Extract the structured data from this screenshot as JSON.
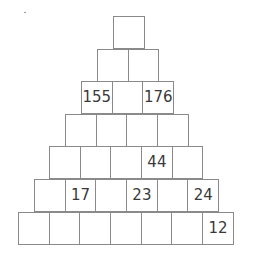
{
  "puzzle": {
    "type": "number-pyramid",
    "rows": [
      [
        ""
      ],
      [
        "",
        ""
      ],
      [
        "155",
        "",
        "176"
      ],
      [
        "",
        "",
        "",
        ""
      ],
      [
        "",
        "",
        "",
        "44",
        ""
      ],
      [
        "",
        "17",
        "",
        "23",
        "",
        "24"
      ],
      [
        "",
        "",
        "",
        "",
        "",
        "",
        "12"
      ]
    ]
  }
}
